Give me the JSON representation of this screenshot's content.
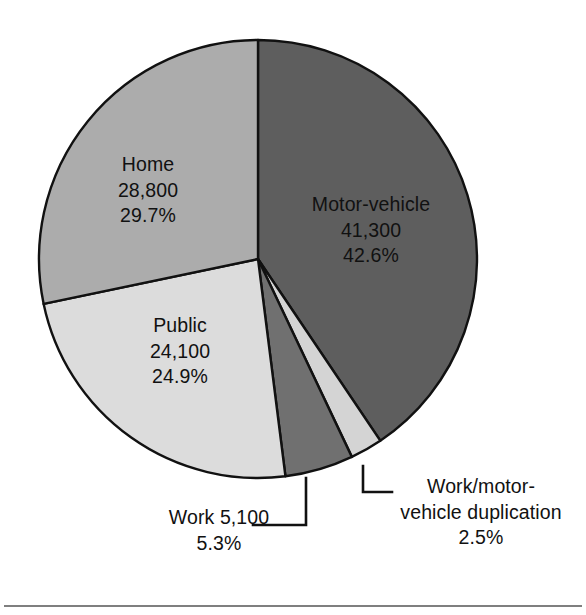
{
  "chart_data": {
    "type": "pie",
    "title": "",
    "subtitle": "",
    "legend_position": "none",
    "grid": false,
    "total_label": "",
    "start_angle_deg": 0,
    "direction": "clockwise",
    "categories": [
      "Motor-vehicle",
      "Work/motor-vehicle duplication",
      "Work",
      "Public",
      "Home"
    ],
    "values": [
      42.6,
      2.5,
      5.3,
      24.9,
      29.7
    ],
    "counts": [
      "41,300",
      "",
      "5,100",
      "24,100",
      "28,800"
    ],
    "slices": [
      {
        "name": "Motor-vehicle",
        "value_label": "41,300",
        "percent_label": "42.6%",
        "percent": 42.6,
        "count": 41300,
        "color": "#5e5e5e",
        "label_placement": "inside"
      },
      {
        "name": "Work/motor-vehicle duplication",
        "name_line1": "Work/motor-",
        "name_line2": "vehicle duplication",
        "value_label": "",
        "percent_label": "2.5%",
        "percent": 2.5,
        "count": null,
        "color": "#d4d4d4",
        "label_placement": "callout"
      },
      {
        "name": "Work",
        "value_label": "5,100",
        "percent_label": "5.3%",
        "percent": 5.3,
        "count": 5100,
        "color": "#707070",
        "label_placement": "callout"
      },
      {
        "name": "Public",
        "value_label": "24,100",
        "percent_label": "24.9%",
        "percent": 24.9,
        "count": 24100,
        "color": "#dcdcdc",
        "label_placement": "inside"
      },
      {
        "name": "Home",
        "value_label": "28,800",
        "percent_label": "29.7%",
        "percent": 29.7,
        "count": 28800,
        "color": "#acacac",
        "label_placement": "inside"
      }
    ],
    "xlabel": "",
    "ylabel": ""
  },
  "colors": {
    "background": "#ffffff",
    "outline": "#111111",
    "text": "#111111",
    "rule": "#555555",
    "motor_vehicle": "#5e5e5e",
    "home": "#acacac",
    "public": "#dcdcdc",
    "work": "#707070",
    "duplication": "#d4d4d4"
  },
  "labels": {
    "motor_vehicle": {
      "name": "Motor-vehicle",
      "value": "41,300",
      "percent": "42.6%"
    },
    "home": {
      "name": "Home",
      "value": "28,800",
      "percent": "29.7%"
    },
    "public": {
      "name": "Public",
      "value": "24,100",
      "percent": "24.9%"
    },
    "work": {
      "name": "Work",
      "value": "5,100",
      "percent": "5.3%"
    },
    "duplication": {
      "name_line1": "Work/motor-",
      "name_line2": "vehicle duplication",
      "percent": "2.5%"
    }
  }
}
